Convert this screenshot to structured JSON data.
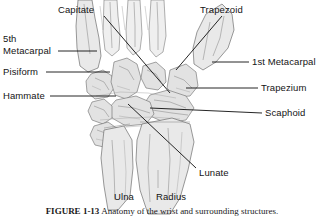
{
  "figure": {
    "caption_number": "FIGURE 1-13",
    "caption_text": "Anatomy of the wrist and surrounding structures.",
    "colors": {
      "bone_fill": "#e9e9e9",
      "bone_outline": "#6f6f6f",
      "leader_line": "#0d0d0d",
      "text": "#141414",
      "background": "#ffffff"
    }
  },
  "labels": {
    "capitate": "Capitate",
    "trapezoid": "Trapezoid",
    "fifth_metacarpal_line1": "5th",
    "fifth_metacarpal_line2": "Metacarpal",
    "first_metacarpal": "1st Metacarpal",
    "pisiform": "Pisiform",
    "trapezium": "Trapezium",
    "hammate": "Hammate",
    "scaphoid": "Scaphoid",
    "lunate": "Lunate",
    "ulna": "Ulna",
    "radius": "Radius"
  }
}
